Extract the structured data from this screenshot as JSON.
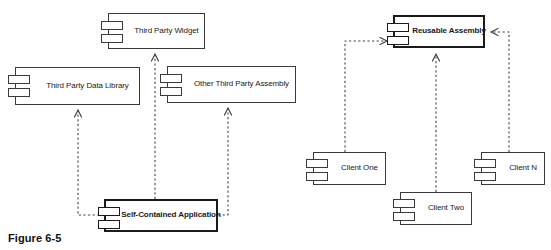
{
  "figure": {
    "caption": "Figure 6-5",
    "caption_x": 8,
    "caption_y": 232
  },
  "diagram": {
    "type": "uml-component-diagram",
    "notation": "UML component diagram with dashed open-arrow dependency relationships",
    "left_group_title": "Self-contained application depending on third party components",
    "right_group_title": "Reusable assembly shared by multiple clients",
    "nodes": [
      {
        "id": "third-party-widget",
        "label": "Third Party Widget",
        "x": 108,
        "y": 13,
        "w": 97,
        "h": 36,
        "emphasis": "normal",
        "group": "left"
      },
      {
        "id": "third-party-data-library",
        "label": "Third Party Data Library",
        "x": 15,
        "y": 67,
        "w": 125,
        "h": 38,
        "emphasis": "normal",
        "group": "left"
      },
      {
        "id": "other-third-party-assembly",
        "label": "Other Third Party Assembly",
        "x": 167,
        "y": 66,
        "w": 129,
        "h": 37,
        "emphasis": "normal",
        "group": "left"
      },
      {
        "id": "self-contained-application",
        "label": "Self-Contained Application",
        "x": 104,
        "y": 199,
        "w": 114,
        "h": 33,
        "emphasis": "bold",
        "group": "left"
      },
      {
        "id": "reusable-assembly",
        "label": "Reusable Assembly",
        "x": 393,
        "y": 15,
        "w": 92,
        "h": 33,
        "emphasis": "bold",
        "group": "right"
      },
      {
        "id": "client-one",
        "label": "Client One",
        "x": 313,
        "y": 152,
        "w": 73,
        "h": 33,
        "emphasis": "normal",
        "group": "right"
      },
      {
        "id": "client-two",
        "label": "Client Two",
        "x": 400,
        "y": 192,
        "w": 72,
        "h": 33,
        "emphasis": "normal",
        "group": "right"
      },
      {
        "id": "client-n",
        "label": "Client N",
        "x": 481,
        "y": 152,
        "w": 64,
        "h": 33,
        "emphasis": "normal",
        "group": "right"
      }
    ],
    "edges": [
      {
        "id": "app-to-data-library",
        "from": "self-contained-application",
        "to": "third-party-data-library",
        "style": "dashed",
        "arrow": "open",
        "points": "104,215 78,215 78,110"
      },
      {
        "id": "app-to-widget",
        "from": "self-contained-application",
        "to": "third-party-widget",
        "style": "dashed",
        "arrow": "open",
        "points": "155,199 155,54"
      },
      {
        "id": "app-to-other-assembly",
        "from": "self-contained-application",
        "to": "other-third-party-assembly",
        "style": "dashed",
        "arrow": "open",
        "points": "218,215 228,215 228,108"
      },
      {
        "id": "client-one-to-reusable-assembly",
        "from": "client-one",
        "to": "reusable-assembly",
        "style": "dashed",
        "arrow": "open",
        "points": "345,152 345,41 387,41"
      },
      {
        "id": "client-two-to-reusable-assembly",
        "from": "client-two",
        "to": "reusable-assembly",
        "style": "dashed",
        "arrow": "open",
        "points": "436,192 436,54"
      },
      {
        "id": "client-n-to-reusable-assembly",
        "from": "client-n",
        "to": "reusable-assembly",
        "style": "dashed",
        "arrow": "open",
        "points": "509,152 509,32 491,32"
      }
    ]
  },
  "colors": {
    "background": "#ffffff",
    "node_stroke": "#3a3a3a",
    "node_stroke_bold": "#1a1a1a",
    "edge_stroke": "#444444",
    "text": "#1a1a1a"
  }
}
